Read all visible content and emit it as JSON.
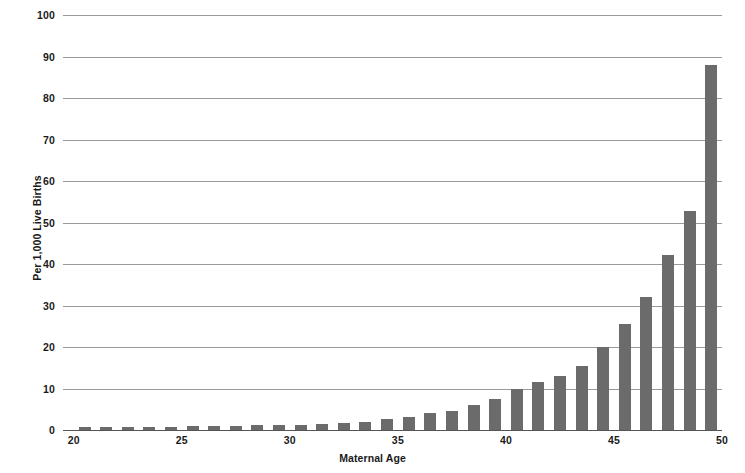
{
  "chart_data": {
    "type": "bar",
    "title": "",
    "xlabel": "Maternal Age",
    "ylabel": "Per 1,000 Live Births",
    "xlim": [
      19.5,
      50
    ],
    "ylim": [
      0,
      100
    ],
    "ytick_labels": [
      "0",
      "10",
      "20",
      "30",
      "40",
      "50",
      "60",
      "70",
      "80",
      "90",
      "100"
    ],
    "ytick_values": [
      0,
      10,
      20,
      30,
      40,
      50,
      60,
      70,
      80,
      90,
      100
    ],
    "xtick_labels": [
      "20",
      "25",
      "30",
      "35",
      "40",
      "45",
      "50"
    ],
    "xtick_values": [
      20,
      25,
      30,
      35,
      40,
      45,
      50
    ],
    "grid": true,
    "legend": "none",
    "bar_color": "#6b6b6b",
    "gridline_color": "#9a9a9a",
    "axis_color": "#555555",
    "background_color": "#ffffff",
    "categories": [
      20,
      21,
      22,
      23,
      24,
      25,
      26,
      27,
      28,
      29,
      30,
      31,
      32,
      33,
      34,
      35,
      36,
      37,
      38,
      39,
      40,
      41,
      42,
      43,
      44,
      45,
      46,
      47,
      48,
      49
    ],
    "values": [
      0.8,
      0.7,
      0.7,
      0.8,
      0.8,
      0.9,
      0.9,
      1.0,
      1.1,
      1.2,
      1.3,
      1.4,
      1.6,
      2.0,
      2.6,
      3.2,
      4.0,
      4.6,
      6.0,
      7.4,
      9.8,
      11.5,
      13.0,
      15.5,
      19.9,
      25.5,
      32.0,
      42.1,
      52.8,
      68.2
    ],
    "values_note": "Last bar (age 49) = 88.0",
    "series": [
      {
        "name": "Rate per 1,000 live births",
        "values": [
          0.8,
          0.7,
          0.7,
          0.8,
          0.8,
          0.9,
          0.9,
          1.0,
          1.1,
          1.2,
          1.3,
          1.4,
          1.6,
          2.0,
          2.6,
          3.2,
          4.0,
          4.6,
          6.0,
          7.4,
          9.8,
          11.5,
          13.0,
          15.5,
          19.9,
          25.5,
          32.0,
          42.1,
          52.8,
          88.0
        ]
      }
    ]
  },
  "axes": {
    "y_title": "Per 1,000 Live Births",
    "x_title": "Maternal Age"
  }
}
